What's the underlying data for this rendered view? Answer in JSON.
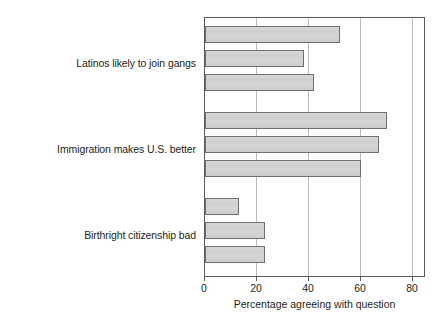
{
  "chart_data": {
    "type": "bar",
    "orientation": "horizontal",
    "title": "",
    "xlabel": "Percentage agreeing with question",
    "ylabel": "",
    "xlim": [
      0,
      85
    ],
    "xticks": [
      0,
      20,
      40,
      60,
      80
    ],
    "xtick_labels": [
      "0",
      "20",
      "40",
      "60",
      "80"
    ],
    "grid": "vertical",
    "legend": "none",
    "bar_color": "#d2d2d2",
    "bar_edge_color": "#6e6e6e",
    "groups": [
      {
        "label": "Latinos likely to join gangs",
        "categories": [
          "Urban",
          "Suburban",
          "Rural"
        ],
        "values": [
          52,
          38,
          42
        ]
      },
      {
        "label": "Immigration makes U.S. better",
        "categories": [
          "Urban",
          "Suburban",
          "Rural"
        ],
        "values": [
          70,
          67,
          60
        ]
      },
      {
        "label": "Birthright citizenship bad",
        "categories": [
          "Urban",
          "Suburban",
          "Rural"
        ],
        "values": [
          13,
          23,
          23
        ]
      }
    ]
  },
  "axis": {
    "x_title": "Percentage agreeing with question",
    "ticks": [
      {
        "value": "0"
      },
      {
        "value": "20"
      },
      {
        "value": "40"
      },
      {
        "value": "60"
      },
      {
        "value": "80"
      }
    ]
  },
  "labels": {
    "group1": "Latinos likely to join gangs",
    "group2": "Immigration makes U.S. better",
    "group3": "Birthright citizenship bad",
    "urban": "Urban",
    "suburban": "Suburban",
    "rural": "Rural"
  }
}
